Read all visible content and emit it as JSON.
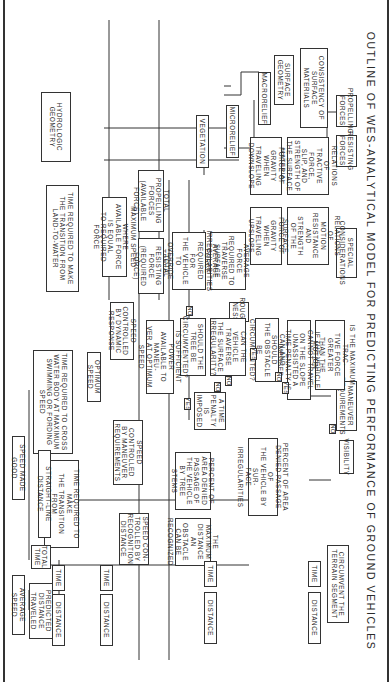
{
  "title": "OUTLINE OF WES-ANALYTICAL MODEL FOR PREDICTING PERFORMANCE OF GROUND VEHICLES",
  "boxes": {
    "propelling_forces": "PROPELLING\nFORCES",
    "resisting_forces": "RESISTING\nFORCES",
    "special_considerations": "SPECIAL\nCONSIDERATIONS",
    "maneuver_requirements": "MANEUVER\nREQUIREMENTS",
    "visibility": "VISIBILITY",
    "surface_geometry": "SURFACE\nGEOMETRY",
    "consistency_surface": "CONSISTENCY OF\nSURFACE MATERIALS",
    "macrorelief": "MACRORELIEF",
    "microrelief": "MICRORELIEF",
    "vegetation": "VEGETATION",
    "hydrologic_geometry": "HYDROLOGIC\nGEOMETRY",
    "relations_tractive": "RELATIONS OF\nTRACTIVE FORCE,\nSLIP, AND\nSTRENGTH OF\nTHE SURFACE\nMATERIAL",
    "relations_motion": "RELATIONS OF\nMOTION\nRESISTANCE\nAND STRENGTH\nOF THE SURFACE\nMATERIAL",
    "gravity_downslope": "FORCE OF\nGRAVITY WHEN\nTRAVELING\nDOWNSLOPE",
    "gravity_upslope": "FORCE OF\nGRAVITY WHEN\nTRAVELING\nUPSLOPE",
    "avg_force_surface": "AVERAGE FORCE\nREQUIRED TO\nTRAVERSE SURFACE\nIRREGULARITIES",
    "avg_force_trees": "AVERAGE FORCE\nREQUIRED FOR\nTHE VEHICLE TO\nOVERRIDE TREES",
    "total_propelling": "TOTAL PROPELLING\nFORCES\n(AVAILABLE FORCE)",
    "total_resisting": "TOTAL RESISTING\nFORCE\n(REQUIRED FORCE)",
    "max_speed": "MAXIMUM SPEED WHERE\nAVAILABLE FORCE IS EQUAL\nTO REQUIRED FORCE",
    "time_land_to_water": "TIME REQUIRED TO MAKE\nTHE TRANSITION FROM\nLAND-TO-WATER",
    "max_tractive_q": "IS THE MAXIMUM TRAC-\nTIVE FORCE GREATER\nTHAN THE MOTION\nRESISTANCE?",
    "slope_penalty": "IF THE VEHICLE CANNOT TRAVEL\nON THE SLOPE UNASSISTED A\nTIME PENALTY IS IMPOSED",
    "obstacle_circumvent_q": "CAN AND SHOULD\nTHE OBSTACLE BE\nCIRCUMVENTED?",
    "roughness": "ROUGH-\nNESS",
    "can_traverse_q": "CAN THE\nVEHICLE\nTRAVERSE\nTHE SURFACE\nIRREGULARITY?",
    "tree_circumvent_q": "SHOULD THE\nTREE BE\nCIRCUMVENTED?",
    "sufficient_power_q": "IS SUFFICIENT POWER\nAVAILABLE TO MANEU-\nVER AT OPTIMUM SPEED",
    "speed_dynamic": "SPEED CONTROLLED\nBY DYNAMIC\nRESPONSE",
    "optimum_speed": "OPTIMUM SPEED",
    "time_cross_water": "TIME REQUIRED TO CROSS\nWATER BODY AT MAXIMUM\nSWIMMING OR FORDING\nSPEED",
    "time_penalty": "A TIME\nPENALTY\nIS\nIMPOSED",
    "pct_area_surface": "PERCENT OF AREA\nDENIED PASSAGE OF\nTHE VEHICLE BY SUR-\nFACE IRREGULARITIES",
    "pct_area_trees": "PERCENT OF\nAREA DENIED\nPASSAGE OF\nTHE VEHICLE\nBY TREE STEMS",
    "max_distance_obstacle": "THE MAXIMUM\nDISTANCE AN\nOBSTACLE\nCAN BE\nRECOGNIZED",
    "speed_maneuver": "SPEED CONTROLLED\nBY MANEUVER\nREQUIREMENTS",
    "speed_recognition": "SPEED CON-\nTROLLED BY\nRECOGNITION\nDISTANCE",
    "time_water_to_land": "TIME REQUIRED TO MAKE\nTHE TRANSITION FROM\nWATER-TO-LAND",
    "circumvent_segment": "CIRCUMVENT THE\nTERRAIN SEGMENT",
    "straight_line_distance": "STRAIGHT-LINE DISTANCE",
    "speed_made_good": "SPEED MADE GOOD",
    "total_time": "TOTAL\nTIME",
    "predicted_distance": "PREDICTED\nDISTANCE\nTRAVELED",
    "average_speed": "AVERAGE SPEED",
    "time_a": "TIME",
    "time_b": "TIME",
    "time_c": "TIME",
    "time_d": "TIME",
    "distance_a": "DISTANCE",
    "distance_b": "DISTANCE",
    "distance_c": "DISTANCE",
    "distance_d": "DISTANCE"
  },
  "tags": {
    "yes_1": "YES",
    "no_1": "NO",
    "yes_2": "YES",
    "no_2": "NO",
    "no_3": "NO",
    "yes_3": "YES",
    "no_4": "NO",
    "no_5": "NO"
  }
}
